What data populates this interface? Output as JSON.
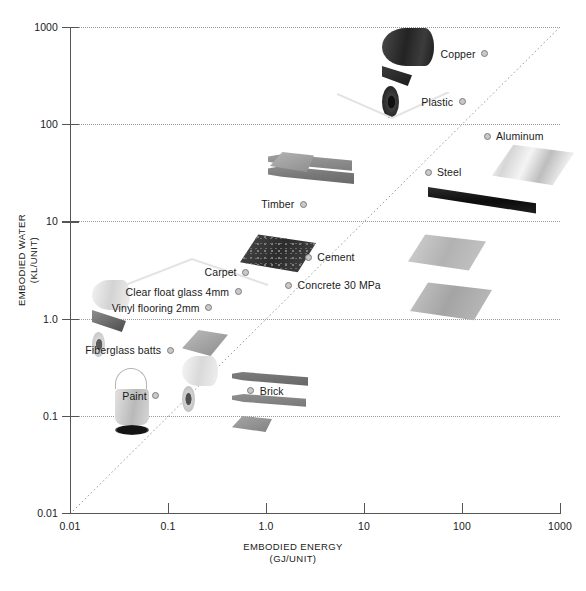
{
  "chart_data": {
    "type": "scatter",
    "title": "",
    "xlabel": "EMBODIED ENERGY",
    "xlabel_units": "(GJ/UNIT)",
    "ylabel": "EMBODIED WATER",
    "ylabel_units": "(KL/UNIT)",
    "xscale": "log",
    "yscale": "log",
    "xlim": [
      0.01,
      1000
    ],
    "ylim": [
      0.01,
      1000
    ],
    "grid": "horizontal-dotted-at-decades",
    "legend": "none (points labelled in place)",
    "annotations": [
      "diagonal dotted reference line y = x from (0.01,0.01) to (1000,1000)"
    ],
    "xticks": [
      "0.01",
      "0.1",
      "1.0",
      "10",
      "100",
      "1000"
    ],
    "yticks": [
      "1000",
      "100",
      "10",
      "1.0",
      "0.1",
      "0.01"
    ],
    "points": [
      {
        "label": "Copper",
        "x": 170,
        "y": 530,
        "label_side": "left"
      },
      {
        "label": "Plastic",
        "x": 100,
        "y": 170,
        "label_side": "left"
      },
      {
        "label": "Aluminum",
        "x": 180,
        "y": 75,
        "label_side": "right"
      },
      {
        "label": "Steel",
        "x": 45,
        "y": 32,
        "label_side": "right"
      },
      {
        "label": "Timber",
        "x": 2.4,
        "y": 15,
        "label_side": "left"
      },
      {
        "label": "Cement",
        "x": 2.7,
        "y": 4.3,
        "label_side": "right"
      },
      {
        "label": "Carpet",
        "x": 0.62,
        "y": 3.0,
        "label_side": "left"
      },
      {
        "label": "Concrete 30 MPa",
        "x": 1.7,
        "y": 2.2,
        "label_side": "right"
      },
      {
        "label": "Clear float glass 4mm",
        "x": 0.52,
        "y": 1.9,
        "label_side": "left"
      },
      {
        "label": "Vinyl flooring 2mm",
        "x": 0.26,
        "y": 1.3,
        "label_side": "left"
      },
      {
        "label": "Fiberglass batts",
        "x": 0.105,
        "y": 0.47,
        "label_side": "left"
      },
      {
        "label": "Brick",
        "x": 0.7,
        "y": 0.18,
        "label_side": "right"
      },
      {
        "label": "Paint",
        "x": 0.075,
        "y": 0.16,
        "label_side": "left"
      }
    ]
  },
  "axes": {
    "y_title_line1": "EMBODIED WATER",
    "y_title_line2": "(KL/UNIT)",
    "x_title_line1": "EMBODIED ENERGY",
    "x_title_line2": "(GJ/UNIT)",
    "y_ticks": [
      {
        "value": 1000,
        "text": "1000"
      },
      {
        "value": 100,
        "text": "100"
      },
      {
        "value": 10,
        "text": "10"
      },
      {
        "value": 1,
        "text": "1.0"
      },
      {
        "value": 0.1,
        "text": "0.1"
      },
      {
        "value": 0.01,
        "text": "0.01"
      }
    ],
    "x_ticks": [
      {
        "value": 0.01,
        "text": "0.01"
      },
      {
        "value": 0.1,
        "text": "0.1"
      },
      {
        "value": 1,
        "text": "1.0"
      },
      {
        "value": 10,
        "text": "10"
      },
      {
        "value": 100,
        "text": "100"
      },
      {
        "value": 1000,
        "text": "1000"
      }
    ]
  },
  "colors": {
    "axis": "#555555",
    "grid": "#9a9a9a",
    "text": "#1a1a1a",
    "marker_fill": "#c9c9c9",
    "marker_edge": "#7d7d7d",
    "leader_line": "#e0e0e0"
  }
}
